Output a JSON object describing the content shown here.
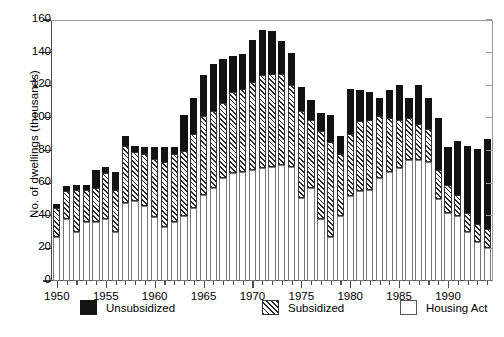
{
  "chart_data": {
    "type": "bar",
    "subtype": "stacked-vertical",
    "title": "",
    "xlabel": "",
    "ylabel": "No. of dwellings (thousands)",
    "ylim": [
      0,
      160
    ],
    "ytick_step": 20,
    "ytick_labels": [
      "0",
      "20",
      "40",
      "60",
      "80",
      "100",
      "120",
      "140",
      "160"
    ],
    "xlim": [
      1949.4,
      1994.6
    ],
    "xtick_labels": [
      "1950",
      "1955",
      "1960",
      "1965",
      "1970",
      "1975",
      "1980",
      "1985",
      "1990"
    ],
    "xtick_values": [
      1950,
      1955,
      1960,
      1965,
      1970,
      1975,
      1980,
      1985,
      1990
    ],
    "xtick_minor_every": 1,
    "grid": false,
    "legend_position": "bottom",
    "categories": [
      1950,
      1951,
      1952,
      1953,
      1954,
      1955,
      1956,
      1957,
      1958,
      1959,
      1960,
      1961,
      1962,
      1963,
      1964,
      1965,
      1966,
      1967,
      1968,
      1969,
      1970,
      1971,
      1972,
      1973,
      1974,
      1975,
      1976,
      1977,
      1978,
      1979,
      1980,
      1981,
      1982,
      1983,
      1984,
      1985,
      1986,
      1987,
      1988,
      1989,
      1990,
      1991,
      1992,
      1993,
      1994
    ],
    "series": [
      {
        "name": "Housing Act",
        "color": "#ffffff",
        "pattern": "solid-white",
        "values": [
          27,
          38,
          30,
          36,
          36,
          38,
          30,
          48,
          49,
          46,
          39,
          33,
          36,
          40,
          45,
          53,
          57,
          63,
          66,
          67,
          68,
          69,
          70,
          71,
          70,
          51,
          57,
          38,
          27,
          40,
          52,
          55,
          56,
          63,
          67,
          69,
          74,
          74,
          73,
          50,
          42,
          40,
          30,
          24,
          20
        ]
      },
      {
        "name": "Subsidized",
        "color": "#2b2b2b",
        "pattern": "diagonal-hatch",
        "values": [
          18,
          17,
          26,
          20,
          21,
          28,
          26,
          35,
          30,
          32,
          36,
          40,
          42,
          40,
          45,
          48,
          47,
          46,
          50,
          51,
          54,
          57,
          57,
          56,
          50,
          53,
          42,
          54,
          58,
          38,
          38,
          43,
          43,
          38,
          33,
          30,
          26,
          22,
          20,
          18,
          17,
          13,
          12,
          11,
          12
        ]
      },
      {
        "name": "Unsubsidized",
        "color": "#121212",
        "pattern": "solid-black",
        "values": [
          2,
          3,
          3,
          3,
          11,
          4,
          11,
          6,
          4,
          4,
          7,
          9,
          4,
          22,
          22,
          25,
          29,
          27,
          22,
          21,
          26,
          28,
          26,
          20,
          20,
          15,
          12,
          11,
          17,
          11,
          28,
          19,
          17,
          11,
          17,
          21,
          12,
          24,
          19,
          32,
          23,
          33,
          41,
          46,
          55
        ]
      }
    ],
    "stack_order_bottom_to_top": [
      "Housing Act",
      "Subsidized",
      "Unsubsidized"
    ]
  },
  "legend": {
    "items": [
      {
        "label": "Unsubsidized",
        "swatch": "unsub"
      },
      {
        "label": "Subsidized",
        "swatch": "subs"
      },
      {
        "label": "Housing Act",
        "swatch": "housing"
      }
    ]
  },
  "colors": {
    "axis": "#4d4d4d",
    "frame": "#9a9a9a",
    "unsubsidized": "#121212",
    "subsidized_hatch": "#2b2b2b",
    "housing_act": "#ffffff",
    "background": "#ffffff"
  }
}
